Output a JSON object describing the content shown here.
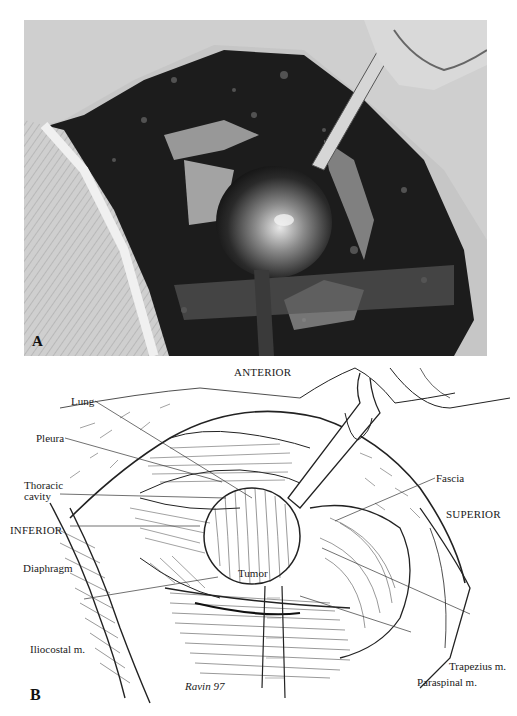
{
  "figure": {
    "panels": [
      {
        "id": "A",
        "letter": "A",
        "kind": "intraoperative-photograph",
        "tone": "grayscale"
      },
      {
        "id": "B",
        "letter": "B",
        "kind": "line-illustration",
        "orientation": {
          "top": "ANTERIOR",
          "left": "INFERIOR",
          "right": "SUPERIOR"
        },
        "labels": {
          "lung": "Lung",
          "pleura": "Pleura",
          "thoracic_cavity_line1": "Thoracic",
          "thoracic_cavity_line2": "cavity",
          "diaphragm": "Diaphragm",
          "iliocostal": "Iliocostal m.",
          "tumor": "Tumor",
          "fascia": "Fascia",
          "trapezius": "Trapezius m.",
          "paraspinal": "Paraspinal m."
        },
        "signature": "Ravin 97"
      }
    ]
  }
}
